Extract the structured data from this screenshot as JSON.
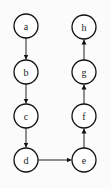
{
  "diagram": {
    "type": "directed-graph",
    "nodes": [
      {
        "id": "a",
        "label": "a",
        "x": 26,
        "y": 26
      },
      {
        "id": "b",
        "label": "b",
        "x": 26,
        "y": 72
      },
      {
        "id": "c",
        "label": "c",
        "x": 26,
        "y": 116
      },
      {
        "id": "d",
        "label": "d",
        "x": 26,
        "y": 160
      },
      {
        "id": "e",
        "label": "e",
        "x": 84,
        "y": 160
      },
      {
        "id": "f",
        "label": "f",
        "x": 84,
        "y": 116
      },
      {
        "id": "g",
        "label": "g",
        "x": 84,
        "y": 72
      },
      {
        "id": "h",
        "label": "h",
        "x": 84,
        "y": 27
      }
    ],
    "edges": [
      {
        "from": "a",
        "to": "b"
      },
      {
        "from": "b",
        "to": "c"
      },
      {
        "from": "c",
        "to": "d"
      },
      {
        "from": "d",
        "to": "e"
      },
      {
        "from": "e",
        "to": "f"
      },
      {
        "from": "f",
        "to": "g"
      },
      {
        "from": "g",
        "to": "h"
      }
    ],
    "node_radius": 12,
    "colors": {
      "stroke": "#111111",
      "fill": "#ffffff",
      "background": "#fbfbfb"
    }
  }
}
